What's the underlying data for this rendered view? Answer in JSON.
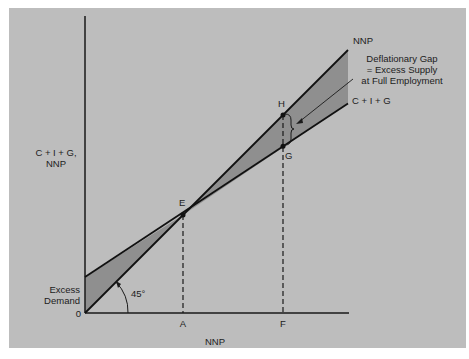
{
  "diagram": {
    "y_axis_label_line1": "C + I + G,",
    "y_axis_label_line2": "NNP",
    "x_axis_label": "NNP",
    "origin_label": "0",
    "lines": [
      {
        "name": "NNP",
        "label": "NNP",
        "description": "45-degree line",
        "intercept": 0,
        "slope": 1
      },
      {
        "name": "C+I+G",
        "label": "C + I + G",
        "description": "aggregate expenditure line",
        "intercept": 36,
        "slope": 0.66
      }
    ],
    "angle_label": "45°",
    "points": {
      "E": {
        "label": "E",
        "x": 98,
        "y": 102
      },
      "H": {
        "label": "H",
        "x": 198,
        "y": 201
      },
      "G": {
        "label": "G",
        "x": 198,
        "y": 166
      }
    },
    "x_markers": [
      {
        "label": "A",
        "x": 98
      },
      {
        "label": "F",
        "x": 198
      }
    ],
    "annotations": {
      "excess_demand_line1": "Excess",
      "excess_demand_line2": "Demand",
      "gap_line1": "Deflationary Gap",
      "gap_line2": "= Excess Supply",
      "gap_line3": "at Full Employment"
    },
    "colors": {
      "background": "#bdbdbd",
      "shade": "#8f8f8f",
      "ink": "#1a1a1a"
    }
  }
}
